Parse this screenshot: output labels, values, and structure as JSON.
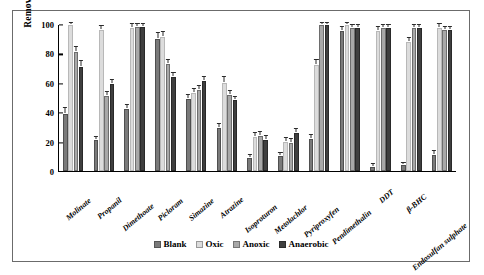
{
  "chart_data": {
    "type": "bar",
    "title": "",
    "subtitle": "",
    "xlabel": "",
    "ylabel": "Removal %",
    "ylim": [
      0,
      100
    ],
    "yticks": [
      0,
      20,
      40,
      60,
      80,
      100
    ],
    "grid": false,
    "legend_position": "bottom-center",
    "categories": [
      "Molinate",
      "Propanil",
      "Dimethoate",
      "Picloram",
      "Simazine",
      "Atrazine",
      "Isoproturon",
      "Metolachlor",
      "Pyriproxyfen",
      "Pendimethalin",
      "DDT",
      "β-BHC",
      "Endosulfan sulphate"
    ],
    "series": [
      {
        "name": "Blank",
        "color": "#7a7a7a",
        "values": [
          39,
          21,
          42,
          90,
          49,
          29,
          9,
          10,
          22,
          95,
          3,
          4,
          11
        ],
        "errors": [
          3,
          1.5,
          2,
          3,
          2,
          2,
          1.5,
          1.5,
          2,
          2,
          1,
          1,
          2
        ]
      },
      {
        "name": "Oxic",
        "color": "#dcdcdc",
        "values": [
          99,
          96,
          97,
          91,
          53,
          60,
          23,
          20,
          72,
          99,
          95,
          88,
          97
        ],
        "errors": [
          1,
          2,
          2,
          3,
          2,
          3,
          2,
          2,
          3,
          1,
          2,
          2,
          2
        ]
      },
      {
        "name": "Anoxic",
        "color": "#a8a8a8",
        "values": [
          81,
          51,
          98,
          73,
          55,
          52,
          24,
          19,
          99,
          97,
          97,
          97,
          96
        ],
        "errors": [
          3,
          2,
          1.5,
          2,
          2,
          2,
          2,
          2,
          1,
          1.5,
          1.5,
          1.5,
          1.5
        ]
      },
      {
        "name": "Anaerobic",
        "color": "#3f3f3f",
        "values": [
          71,
          59,
          98,
          64,
          61,
          48,
          21,
          26,
          99,
          97,
          97,
          97,
          96
        ],
        "errors": [
          3,
          2,
          1.5,
          2,
          2,
          2,
          2,
          2,
          1,
          1.5,
          1.5,
          1.5,
          1.5
        ]
      }
    ]
  },
  "legend": {
    "items": [
      {
        "label": "Blank"
      },
      {
        "label": "Oxic"
      },
      {
        "label": "Anoxic"
      },
      {
        "label": "Anaerobic"
      }
    ]
  },
  "axis": {
    "y_title": "Removal %",
    "ticks": [
      "0",
      "20",
      "40",
      "60",
      "80",
      "100"
    ]
  }
}
